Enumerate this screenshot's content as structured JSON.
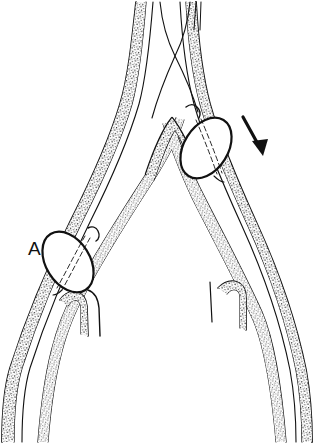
{
  "figure": {
    "background_color": "#ffffff",
    "ink_color": "#111111",
    "width": 320,
    "height": 444,
    "style": "black-and-white line drawing, stippled vessel wall"
  },
  "labels": [
    {
      "id": "label-a",
      "text": "A",
      "x": 28,
      "y": 240,
      "font_size": 19
    }
  ],
  "annotations": {
    "arrow": {
      "name": "direction-arrow",
      "tail_x": 243,
      "tail_y": 117,
      "head_x": 263,
      "head_y": 154,
      "color": "#111111"
    }
  },
  "structures": {
    "aorta": {
      "name": "abdominal-aorta",
      "description": "single trunk above the bifurcation apex"
    },
    "bifurcation_apex": {
      "name": "bifurcation-apex",
      "x": 172,
      "y": 116
    },
    "left_iliac": {
      "name": "left-common-iliac-artery",
      "side": "left",
      "runs_to": "bottom-left"
    },
    "right_iliac": {
      "name": "right-common-iliac-artery",
      "side": "right",
      "runs_to": "bottom-right"
    },
    "branch_stubs": [
      {
        "name": "left-internal-iliac-stub",
        "x": 76,
        "y": 300
      },
      {
        "name": "right-internal-iliac-stub",
        "x": 240,
        "y": 292
      }
    ]
  },
  "balloons": [
    {
      "id": "balloon-left",
      "name": "left-angioplasty-balloon",
      "center_x": 68,
      "center_y": 262,
      "radius_x": 22,
      "radius_y": 33,
      "rotation_deg": 28,
      "state": "inflated",
      "fill": "#ffffff"
    },
    {
      "id": "balloon-right",
      "name": "right-angioplasty-balloon",
      "center_x": 206,
      "center_y": 148,
      "radius_x": 22,
      "radius_y": 33,
      "rotation_deg": 32,
      "state": "inflated",
      "fill": "#ffffff"
    }
  ],
  "guidewires": [
    {
      "name": "guidewire-left",
      "description": "thin wire entering from top, crossing to right balloon"
    },
    {
      "name": "guidewire-right",
      "description": "thin wire entering from top, crossing to left balloon"
    }
  ],
  "crossing_point": {
    "x": 175,
    "y": 56
  }
}
